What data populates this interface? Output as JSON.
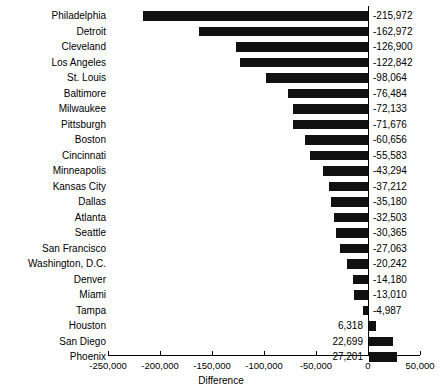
{
  "chart_data": {
    "type": "bar",
    "orientation": "horizontal",
    "title": "",
    "subtitle": "",
    "xlabel": "Difference",
    "ylabel": "",
    "xlim": [
      -250000,
      50000
    ],
    "grid": false,
    "legend": false,
    "bar_color": "#111111",
    "axis_color": "#000000",
    "xticks": [
      -250000,
      -200000,
      -150000,
      -100000,
      -50000,
      0,
      50000
    ],
    "xtick_labels": [
      "-250,000",
      "-200,000",
      "-150,000",
      "-100,000",
      "-50,000",
      "0",
      "50,000"
    ],
    "categories": [
      "Philadelphia",
      "Detroit",
      "Cleveland",
      "Los Angeles",
      "St. Louis",
      "Baltimore",
      "Milwaukee",
      "Pittsburgh",
      "Boston",
      "Cincinnati",
      "Minneapolis",
      "Kansas City",
      "Dallas",
      "Atlanta",
      "Seattle",
      "San Francisco",
      "Washington, D.C.",
      "Denver",
      "Miami",
      "Tampa",
      "Houston",
      "San Diego",
      "Phoenix"
    ],
    "values": [
      -215972,
      -162972,
      -126900,
      -122842,
      -98064,
      -76484,
      -72133,
      -71676,
      -60656,
      -55583,
      -43294,
      -37212,
      -35180,
      -32503,
      -30365,
      -27063,
      -20242,
      -14180,
      -13010,
      -4987,
      6318,
      22699,
      27201
    ],
    "value_labels": [
      "-215,972",
      "-162,972",
      "-126,900",
      "-122,842",
      "-98,064",
      "-76,484",
      "-72,133",
      "-71,676",
      "-60,656",
      "-55,583",
      "-43,294",
      "-37,212",
      "-35,180",
      "-32,503",
      "-30,365",
      "-27,063",
      "-20,242",
      "-14,180",
      "-13,010",
      "-4,987",
      "6,318",
      "22,699",
      "27,201"
    ]
  }
}
